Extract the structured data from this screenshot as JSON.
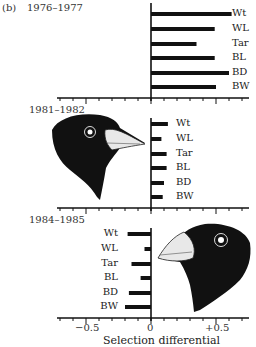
{
  "figure_label": "(b)",
  "panels": [
    {
      "period": "1976–1977",
      "bird_head": "none"
    },
    {
      "period": "1981–1982",
      "bird_head": "left-facing-right"
    },
    {
      "period": "1984–1985",
      "bird_head": "right-facing-left"
    }
  ],
  "traits": [
    "Wt",
    "WL",
    "Tar",
    "BL",
    "BD",
    "BW"
  ],
  "axis": {
    "tick_labels": [
      "−0.5",
      "0",
      "+0.5"
    ],
    "xlabel": "Selection differential"
  },
  "chart_data": [
    {
      "type": "bar",
      "orientation": "horizontal",
      "title": "1976–1977",
      "categories": [
        "Wt",
        "WL",
        "Tar",
        "BL",
        "BD",
        "BW"
      ],
      "values": [
        0.62,
        0.49,
        0.35,
        0.49,
        0.6,
        0.5
      ],
      "xlabel": "Selection differential",
      "xlim": [
        -0.7,
        0.75
      ],
      "xticks": [
        -0.5,
        0,
        0.5
      ]
    },
    {
      "type": "bar",
      "orientation": "horizontal",
      "title": "1981–1982",
      "categories": [
        "Wt",
        "WL",
        "Tar",
        "BL",
        "BD",
        "BW"
      ],
      "values": [
        0.13,
        0.08,
        0.12,
        0.12,
        0.1,
        0.09
      ],
      "xlabel": "Selection differential",
      "xlim": [
        -0.7,
        0.75
      ],
      "xticks": [
        -0.5,
        0,
        0.5
      ]
    },
    {
      "type": "bar",
      "orientation": "horizontal",
      "title": "1984–1985",
      "categories": [
        "Wt",
        "WL",
        "Tar",
        "BL",
        "BD",
        "BW"
      ],
      "values": [
        -0.18,
        -0.05,
        -0.15,
        -0.08,
        -0.17,
        -0.2
      ],
      "xlabel": "Selection differential",
      "xlim": [
        -0.7,
        0.75
      ],
      "xticks": [
        -0.5,
        0,
        0.5
      ]
    }
  ]
}
